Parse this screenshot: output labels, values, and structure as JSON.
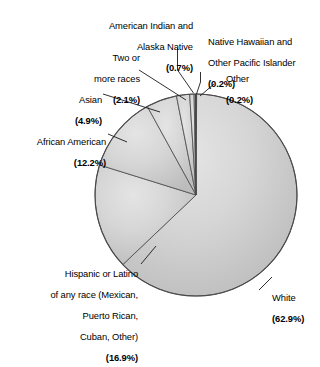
{
  "chart_data": {
    "type": "pie",
    "title": "",
    "subtitle": "",
    "xlabel": "",
    "ylabel": "",
    "legend_position": "none",
    "grid": false,
    "units": "percent",
    "total": 100.1,
    "categories": [
      "White",
      "Hispanic or Latino of any race (Mexican, Puerto Rican, Cuban, Other)",
      "African American",
      "Asian",
      "Two or more races",
      "American Indian and Alaska Native",
      "Native Hawaiian and Other Pacific Islander",
      "Other"
    ],
    "values": [
      62.9,
      16.9,
      12.2,
      4.9,
      2.1,
      0.7,
      0.2,
      0.2
    ],
    "slices": [
      {
        "name": "white",
        "label_lines": [
          "White"
        ],
        "percent_text": "(62.9%)",
        "value": 62.9,
        "color": "#d2d2d2",
        "start_deg": 0,
        "sweep_deg": 226.44
      },
      {
        "name": "hispanic-or-latino",
        "label_lines": [
          "Hispanic or Latino",
          "of any race (Mexican,",
          "Puerto Rican,",
          "Cuban, Other)"
        ],
        "percent_text": "(16.9%)",
        "value": 16.9,
        "color": "#cfcfcf",
        "start_deg": 226.44,
        "sweep_deg": 60.84
      },
      {
        "name": "african-american",
        "label_lines": [
          "African American"
        ],
        "percent_text": "(12.2%)",
        "value": 12.2,
        "color": "#cccccc",
        "start_deg": 287.28,
        "sweep_deg": 43.92
      },
      {
        "name": "asian",
        "label_lines": [
          "Asian"
        ],
        "percent_text": "(4.9%)",
        "value": 4.9,
        "color": "#c9c9c9",
        "start_deg": 331.2,
        "sweep_deg": 17.64
      },
      {
        "name": "two-or-more-races",
        "label_lines": [
          "Two or",
          "more races"
        ],
        "percent_text": "(2.1%)",
        "value": 2.1,
        "color": "#c6c6c6",
        "start_deg": 348.84,
        "sweep_deg": 7.56
      },
      {
        "name": "american-indian-and-alaska-native",
        "label_lines": [
          "American Indian and",
          "Alaska Native"
        ],
        "percent_text": "(0.7%)",
        "value": 0.7,
        "color": "#c4c4c4",
        "start_deg": 356.4,
        "sweep_deg": 2.52
      },
      {
        "name": "native-hawaiian-and-other-pacific-islander",
        "label_lines": [
          "Native Hawaiian and",
          "Other Pacific Islander"
        ],
        "percent_text": "(0.2%)",
        "value": 0.2,
        "color": "#c2c2c2",
        "start_deg": 358.92,
        "sweep_deg": 0.72
      },
      {
        "name": "other",
        "label_lines": [
          "Other"
        ],
        "percent_text": "(0.2%)",
        "value": 0.2,
        "color": "#141414",
        "start_deg": 359.64,
        "sweep_deg": 0.72
      }
    ],
    "geometry": {
      "center_x": 196,
      "center_y": 195,
      "radius": 101
    },
    "style": {
      "background": "#ffffff",
      "outline": "#4a4a4a",
      "leader_line": "#1a1a1a",
      "text": "#000000"
    }
  },
  "labels": {
    "american_indian": {
      "line1": "American Indian and",
      "line2": "Alaska Native",
      "pct": "(0.7%)"
    },
    "native_hawaiian": {
      "line1": "Native Hawaiian and",
      "line2": "Other Pacific Islander",
      "pct": "(0.2%)"
    },
    "other": {
      "line1": "Other",
      "pct": "(0.2%)"
    },
    "two_or_more": {
      "line1": "Two or",
      "line2": "more races",
      "pct": "(2.1%)"
    },
    "asian": {
      "line1": "Asian",
      "pct": "(4.9%)"
    },
    "african_american": {
      "line1": "African American",
      "pct": "(12.2%)"
    },
    "hispanic": {
      "line1": "Hispanic or Latino",
      "line2": "of any race (Mexican,",
      "line3": "Puerto Rican,",
      "line4": "Cuban, Other)",
      "pct": "(16.9%)"
    },
    "white": {
      "line1": "White",
      "pct": "(62.9%)"
    }
  }
}
